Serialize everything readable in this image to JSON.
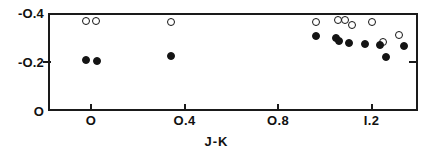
{
  "chart_data": {
    "type": "scatter",
    "title": "",
    "xlabel": "J-K",
    "ylabel": "",
    "xlim": [
      -0.18,
      1.41
    ],
    "ylim": [
      0.0,
      -0.44
    ],
    "grid": false,
    "legend_position": "none",
    "xticks": [
      {
        "value": 0.0,
        "label": "O"
      },
      {
        "value": 0.4,
        "label": "O.4"
      },
      {
        "value": 0.8,
        "label": "O.8"
      },
      {
        "value": 1.2,
        "label": "I.2"
      }
    ],
    "yticks": [
      {
        "value": -0.4,
        "label": "-O.4"
      },
      {
        "value": -0.2,
        "label": "-O.2"
      },
      {
        "value": 0.0,
        "label": "O"
      }
    ],
    "series": [
      {
        "name": "open-circles",
        "marker": "open-circle",
        "color": "#141414",
        "points": [
          {
            "x": -0.022,
            "y": -0.367
          },
          {
            "x": 0.021,
            "y": -0.367
          },
          {
            "x": 0.343,
            "y": -0.365
          },
          {
            "x": 0.961,
            "y": -0.365
          },
          {
            "x": 1.055,
            "y": -0.372
          },
          {
            "x": 1.085,
            "y": -0.372
          },
          {
            "x": 1.118,
            "y": -0.352
          },
          {
            "x": 1.203,
            "y": -0.365
          },
          {
            "x": 1.319,
            "y": -0.312
          },
          {
            "x": 1.25,
            "y": -0.28
          }
        ]
      },
      {
        "name": "filled-circles",
        "marker": "filled-circle",
        "color": "#141414",
        "points": [
          {
            "x": -0.022,
            "y": -0.208
          },
          {
            "x": 0.026,
            "y": -0.206
          },
          {
            "x": 0.343,
            "y": -0.224
          },
          {
            "x": 0.961,
            "y": -0.308
          },
          {
            "x": 1.05,
            "y": -0.296
          },
          {
            "x": 1.063,
            "y": -0.285
          },
          {
            "x": 1.105,
            "y": -0.276
          },
          {
            "x": 1.174,
            "y": -0.272
          },
          {
            "x": 1.236,
            "y": -0.269
          },
          {
            "x": 1.26,
            "y": -0.22
          },
          {
            "x": 1.337,
            "y": -0.265
          }
        ]
      }
    ]
  }
}
